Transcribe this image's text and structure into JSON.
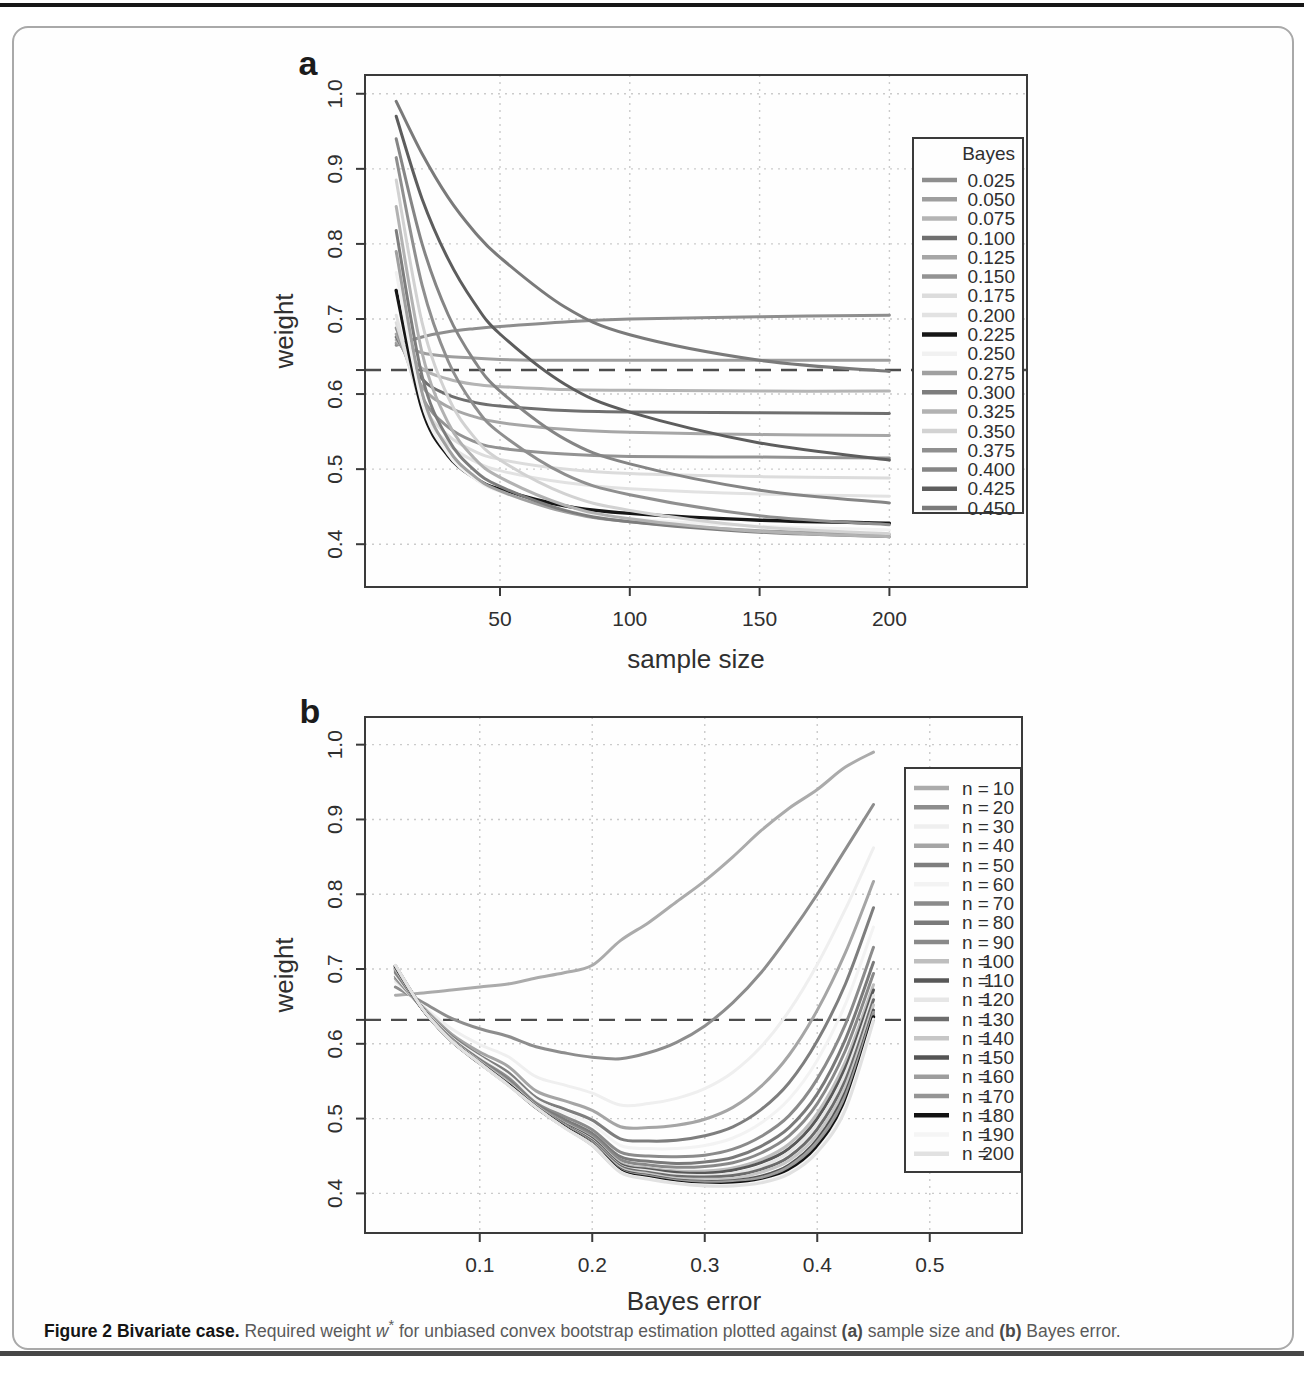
{
  "figure": {
    "panel_a_tag": "a",
    "panel_b_tag": "b"
  },
  "caption": {
    "title": "Figure 2 Bivariate case.",
    "t1": " Required weight ",
    "w": "w",
    "star": "*",
    "t2": " for unbiased convex bootstrap estimation plotted against ",
    "a": "(a)",
    "t3": " sample size and ",
    "b": "(b)",
    "t4": " Bayes error."
  },
  "chart_data": [
    {
      "id": "a",
      "type": "line",
      "title": "",
      "xlabel": "sample size",
      "ylabel": "weight",
      "xlim": [
        -2,
        253
      ],
      "ylim": [
        0.343,
        1.025
      ],
      "grid": "dotted",
      "x_ticks": [
        50,
        100,
        150,
        200
      ],
      "x_tick_labels": [
        "50",
        "100",
        "150",
        "200"
      ],
      "y_ticks": [
        0.4,
        0.5,
        0.6,
        0.7,
        0.8,
        0.9,
        1.0
      ],
      "y_tick_labels": [
        "0.4",
        "0.5",
        "0.6",
        "0.7",
        "0.8",
        "0.9",
        "1.0"
      ],
      "extra_y_tick": 0.632,
      "dashed_hline": 0.632,
      "legend": {
        "title": "Bayes",
        "position": "topright"
      },
      "x": [
        10,
        20,
        30,
        40,
        50,
        75,
        100,
        150,
        200
      ],
      "series": [
        {
          "name": "0.025",
          "color": "#8e8e8e",
          "values": [
            0.665,
            0.676,
            0.683,
            0.687,
            0.69,
            0.696,
            0.7,
            0.703,
            0.705
          ]
        },
        {
          "name": "0.050",
          "color": "#9e9e9e",
          "values": [
            0.668,
            0.655,
            0.65,
            0.648,
            0.646,
            0.645,
            0.645,
            0.645,
            0.645
          ]
        },
        {
          "name": "0.075",
          "color": "#b4b4b4",
          "values": [
            0.672,
            0.634,
            0.62,
            0.613,
            0.61,
            0.606,
            0.605,
            0.604,
            0.604
          ]
        },
        {
          "name": "0.100",
          "color": "#6f6f6f",
          "values": [
            0.676,
            0.62,
            0.599,
            0.589,
            0.584,
            0.578,
            0.576,
            0.575,
            0.574
          ]
        },
        {
          "name": "0.125",
          "color": "#a6a6a6",
          "values": [
            0.68,
            0.61,
            0.583,
            0.57,
            0.562,
            0.553,
            0.549,
            0.546,
            0.545
          ]
        },
        {
          "name": "0.150",
          "color": "#939393",
          "values": [
            0.688,
            0.596,
            0.556,
            0.537,
            0.528,
            0.52,
            0.517,
            0.516,
            0.515
          ]
        },
        {
          "name": "0.175",
          "color": "#dcdcdc",
          "values": [
            0.695,
            0.588,
            0.545,
            0.524,
            0.513,
            0.5,
            0.494,
            0.49,
            0.488
          ]
        },
        {
          "name": "0.200",
          "color": "#e2e2e2",
          "values": [
            0.705,
            0.582,
            0.534,
            0.511,
            0.498,
            0.482,
            0.474,
            0.467,
            0.464
          ]
        },
        {
          "name": "0.225",
          "color": "#161616",
          "values": [
            0.738,
            0.58,
            0.518,
            0.489,
            0.473,
            0.451,
            0.441,
            0.432,
            0.428
          ]
        },
        {
          "name": "0.250",
          "color": "#f1f1f1",
          "values": [
            0.762,
            0.588,
            0.52,
            0.488,
            0.47,
            0.445,
            0.434,
            0.424,
            0.419
          ]
        },
        {
          "name": "0.275",
          "color": "#a0a0a0",
          "values": [
            0.79,
            0.602,
            0.527,
            0.491,
            0.471,
            0.443,
            0.43,
            0.418,
            0.413
          ]
        },
        {
          "name": "0.300",
          "color": "#7d7d7d",
          "values": [
            0.818,
            0.624,
            0.54,
            0.499,
            0.477,
            0.445,
            0.43,
            0.416,
            0.41
          ]
        },
        {
          "name": "0.325",
          "color": "#b2b2b2",
          "values": [
            0.85,
            0.655,
            0.562,
            0.515,
            0.489,
            0.452,
            0.434,
            0.417,
            0.41
          ]
        },
        {
          "name": "0.350",
          "color": "#d2d2d2",
          "values": [
            0.885,
            0.695,
            0.596,
            0.543,
            0.512,
            0.467,
            0.445,
            0.423,
            0.414
          ]
        },
        {
          "name": "0.375",
          "color": "#8f8f8f",
          "values": [
            0.915,
            0.745,
            0.644,
            0.585,
            0.548,
            0.493,
            0.466,
            0.438,
            0.426
          ]
        },
        {
          "name": "0.400",
          "color": "#858585",
          "values": [
            0.94,
            0.8,
            0.706,
            0.645,
            0.604,
            0.54,
            0.507,
            0.472,
            0.455
          ]
        },
        {
          "name": "0.425",
          "color": "#5d5d5d",
          "values": [
            0.97,
            0.86,
            0.78,
            0.722,
            0.68,
            0.613,
            0.576,
            0.535,
            0.512
          ]
        },
        {
          "name": "0.450",
          "color": "#7a7a7a",
          "values": [
            0.99,
            0.92,
            0.862,
            0.817,
            0.782,
            0.716,
            0.679,
            0.645,
            0.63
          ]
        }
      ]
    },
    {
      "id": "b",
      "type": "line",
      "title": "",
      "xlabel": "Bayes error",
      "ylabel": "weight",
      "xlim": [
        -0.002,
        0.582
      ],
      "ylim": [
        0.347,
        1.037
      ],
      "grid": "dotted",
      "x_ticks": [
        0.1,
        0.2,
        0.3,
        0.4,
        0.5
      ],
      "x_tick_labels": [
        "0.1",
        "0.2",
        "0.3",
        "0.4",
        "0.5"
      ],
      "y_ticks": [
        0.4,
        0.5,
        0.6,
        0.7,
        0.8,
        0.9,
        1.0
      ],
      "y_tick_labels": [
        "0.4",
        "0.5",
        "0.6",
        "0.7",
        "0.8",
        "0.9",
        "1.0"
      ],
      "extra_y_tick": 0.632,
      "dashed_hline": 0.632,
      "legend": {
        "title": "",
        "label_prefix": "n =",
        "position": "right"
      },
      "x": [
        0.025,
        0.05,
        0.075,
        0.1,
        0.125,
        0.15,
        0.175,
        0.2,
        0.225,
        0.25,
        0.275,
        0.3,
        0.325,
        0.35,
        0.375,
        0.4,
        0.425,
        0.45
      ],
      "series": [
        {
          "name": "10",
          "color": "#ababab",
          "values": [
            0.665,
            0.668,
            0.672,
            0.676,
            0.68,
            0.688,
            0.695,
            0.705,
            0.738,
            0.762,
            0.79,
            0.818,
            0.85,
            0.885,
            0.915,
            0.94,
            0.97,
            0.99
          ]
        },
        {
          "name": "20",
          "color": "#8d8d8d",
          "values": [
            0.676,
            0.655,
            0.634,
            0.62,
            0.61,
            0.596,
            0.588,
            0.582,
            0.58,
            0.588,
            0.602,
            0.624,
            0.655,
            0.695,
            0.745,
            0.8,
            0.86,
            0.92
          ]
        },
        {
          "name": "30",
          "color": "#efefef",
          "values": [
            0.683,
            0.65,
            0.62,
            0.599,
            0.583,
            0.556,
            0.545,
            0.534,
            0.518,
            0.52,
            0.527,
            0.54,
            0.562,
            0.596,
            0.644,
            0.706,
            0.78,
            0.862
          ]
        },
        {
          "name": "40",
          "color": "#a5a5a5",
          "values": [
            0.687,
            0.648,
            0.613,
            0.589,
            0.57,
            0.537,
            0.524,
            0.511,
            0.489,
            0.488,
            0.491,
            0.499,
            0.515,
            0.543,
            0.585,
            0.645,
            0.722,
            0.817
          ]
        },
        {
          "name": "50",
          "color": "#7e7e7e",
          "values": [
            0.69,
            0.646,
            0.61,
            0.584,
            0.562,
            0.528,
            0.513,
            0.498,
            0.473,
            0.47,
            0.471,
            0.477,
            0.489,
            0.512,
            0.548,
            0.604,
            0.68,
            0.782
          ]
        },
        {
          "name": "60",
          "color": "#f3f3f3",
          "values": [
            0.692,
            0.646,
            0.608,
            0.582,
            0.558,
            0.525,
            0.508,
            0.492,
            0.464,
            0.46,
            0.46,
            0.464,
            0.474,
            0.494,
            0.526,
            0.578,
            0.653,
            0.756
          ]
        },
        {
          "name": "70",
          "color": "#8b8b8b",
          "values": [
            0.695,
            0.645,
            0.607,
            0.579,
            0.555,
            0.521,
            0.503,
            0.485,
            0.455,
            0.45,
            0.449,
            0.451,
            0.459,
            0.476,
            0.504,
            0.553,
            0.626,
            0.729
          ]
        },
        {
          "name": "80",
          "color": "#7a7a7a",
          "values": [
            0.697,
            0.645,
            0.606,
            0.578,
            0.552,
            0.519,
            0.499,
            0.48,
            0.449,
            0.443,
            0.44,
            0.442,
            0.448,
            0.463,
            0.488,
            0.533,
            0.606,
            0.709
          ]
        },
        {
          "name": "90",
          "color": "#898989",
          "values": [
            0.698,
            0.645,
            0.605,
            0.577,
            0.551,
            0.518,
            0.496,
            0.477,
            0.445,
            0.438,
            0.435,
            0.436,
            0.441,
            0.454,
            0.477,
            0.52,
            0.591,
            0.694
          ]
        },
        {
          "name": "100",
          "color": "#bebebe",
          "values": [
            0.7,
            0.645,
            0.605,
            0.576,
            0.549,
            0.517,
            0.494,
            0.474,
            0.441,
            0.434,
            0.43,
            0.43,
            0.434,
            0.445,
            0.466,
            0.507,
            0.576,
            0.679
          ]
        },
        {
          "name": "110",
          "color": "#585858",
          "values": [
            0.701,
            0.645,
            0.605,
            0.576,
            0.548,
            0.517,
            0.493,
            0.473,
            0.439,
            0.432,
            0.428,
            0.427,
            0.431,
            0.441,
            0.46,
            0.5,
            0.568,
            0.672
          ]
        },
        {
          "name": "120",
          "color": "#e6e6e6",
          "values": [
            0.701,
            0.645,
            0.605,
            0.576,
            0.548,
            0.517,
            0.492,
            0.471,
            0.437,
            0.43,
            0.425,
            0.424,
            0.427,
            0.436,
            0.455,
            0.493,
            0.56,
            0.665
          ]
        },
        {
          "name": "130",
          "color": "#6c6c6c",
          "values": [
            0.702,
            0.645,
            0.604,
            0.575,
            0.547,
            0.516,
            0.492,
            0.47,
            0.436,
            0.428,
            0.423,
            0.422,
            0.424,
            0.432,
            0.449,
            0.486,
            0.551,
            0.659
          ]
        },
        {
          "name": "140",
          "color": "#c6c6c6",
          "values": [
            0.702,
            0.645,
            0.604,
            0.575,
            0.547,
            0.516,
            0.491,
            0.468,
            0.434,
            0.426,
            0.42,
            0.419,
            0.42,
            0.428,
            0.444,
            0.479,
            0.543,
            0.652
          ]
        },
        {
          "name": "150",
          "color": "#545454",
          "values": [
            0.703,
            0.645,
            0.604,
            0.575,
            0.546,
            0.516,
            0.49,
            0.467,
            0.432,
            0.424,
            0.418,
            0.416,
            0.417,
            0.423,
            0.438,
            0.472,
            0.535,
            0.645
          ]
        },
        {
          "name": "160",
          "color": "#9d9d9d",
          "values": [
            0.703,
            0.645,
            0.604,
            0.575,
            0.546,
            0.516,
            0.49,
            0.466,
            0.431,
            0.423,
            0.417,
            0.415,
            0.416,
            0.421,
            0.436,
            0.469,
            0.53,
            0.642
          ]
        },
        {
          "name": "170",
          "color": "#959595",
          "values": [
            0.704,
            0.645,
            0.604,
            0.575,
            0.546,
            0.516,
            0.489,
            0.466,
            0.43,
            0.422,
            0.416,
            0.414,
            0.414,
            0.419,
            0.433,
            0.465,
            0.526,
            0.639
          ]
        },
        {
          "name": "180",
          "color": "#121212",
          "values": [
            0.704,
            0.645,
            0.604,
            0.574,
            0.546,
            0.515,
            0.489,
            0.465,
            0.43,
            0.421,
            0.415,
            0.412,
            0.413,
            0.417,
            0.431,
            0.462,
            0.521,
            0.636
          ]
        },
        {
          "name": "190",
          "color": "#f5f5f5",
          "values": [
            0.705,
            0.645,
            0.604,
            0.574,
            0.545,
            0.515,
            0.488,
            0.465,
            0.429,
            0.42,
            0.414,
            0.411,
            0.411,
            0.416,
            0.428,
            0.458,
            0.517,
            0.633
          ]
        },
        {
          "name": "200",
          "color": "#e1e1e1",
          "values": [
            0.705,
            0.645,
            0.604,
            0.574,
            0.545,
            0.515,
            0.488,
            0.464,
            0.428,
            0.419,
            0.413,
            0.41,
            0.41,
            0.414,
            0.426,
            0.455,
            0.512,
            0.63
          ]
        }
      ]
    }
  ]
}
